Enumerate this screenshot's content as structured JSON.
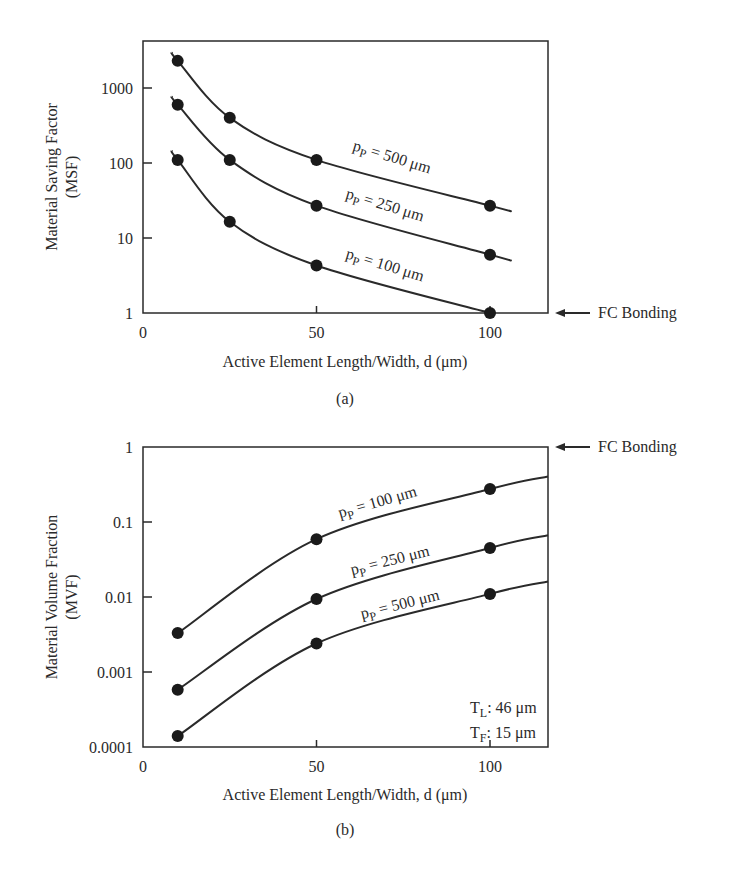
{
  "chart_data": [
    {
      "panel": "(a)",
      "type": "line",
      "title": "",
      "xlabel": "Active Element Length/Width, d (μm)",
      "ylabel": "Material Saving Factor",
      "ylabel_sub": "(MSF)",
      "yscale": "log",
      "xlim": [
        0,
        115
      ],
      "ylim": [
        1,
        4000
      ],
      "x_ticks": [
        0,
        50,
        100
      ],
      "y_ticks": [
        1,
        10,
        100,
        1000
      ],
      "y_tick_labels": [
        "1",
        "10",
        "100",
        "1000"
      ],
      "grid": false,
      "annotation": "FC Bonding",
      "annotation_value": 1,
      "series": [
        {
          "name": "pP = 500 μm",
          "label_main": "p",
          "label_sub": "P",
          "label_rest": " = 500 μm",
          "x": [
            10,
            25,
            50,
            100
          ],
          "values": [
            2300,
            400,
            110,
            27
          ]
        },
        {
          "name": "pP = 250 μm",
          "label_main": "p",
          "label_sub": "P",
          "label_rest": " = 250 μm",
          "x": [
            10,
            25,
            50,
            100
          ],
          "values": [
            600,
            110,
            27,
            6
          ]
        },
        {
          "name": "pP = 100 μm",
          "label_main": "p",
          "label_sub": "P",
          "label_rest": " = 100 μm",
          "x": [
            10,
            25,
            50,
            100
          ],
          "values": [
            110,
            16.5,
            4.3,
            1
          ]
        }
      ]
    },
    {
      "panel": "(b)",
      "type": "line",
      "title": "",
      "xlabel": "Active Element Length/Width, d (μm)",
      "ylabel": "Material Volume Fraction",
      "ylabel_sub": "(MVF)",
      "yscale": "log",
      "xlim": [
        0,
        115
      ],
      "ylim": [
        0.0001,
        1
      ],
      "x_ticks": [
        0,
        50,
        100
      ],
      "y_ticks": [
        0.0001,
        0.001,
        0.01,
        0.1,
        1
      ],
      "y_tick_labels": [
        "0.0001",
        "0.001",
        "0.01",
        "0.1",
        "1"
      ],
      "grid": false,
      "annotation": "FC Bonding",
      "annotation_value": 1,
      "params": [
        {
          "main": "T",
          "sub": "L",
          "rest": ": 46 μm"
        },
        {
          "main": "T",
          "sub": "F",
          "rest": ": 15 μm"
        }
      ],
      "series": [
        {
          "name": "pP = 100 μm",
          "label_main": "p",
          "label_sub": "P",
          "label_rest": " = 100 μm",
          "x": [
            10,
            50,
            100
          ],
          "values": [
            0.0033,
            0.059,
            0.275
          ]
        },
        {
          "name": "pP = 250 μm",
          "label_main": "p",
          "label_sub": "P",
          "label_rest": " = 250 μm",
          "x": [
            10,
            50,
            100
          ],
          "values": [
            0.00058,
            0.0094,
            0.045
          ]
        },
        {
          "name": "pP = 500 μm",
          "label_main": "p",
          "label_sub": "P",
          "label_rest": " = 500 μm",
          "x": [
            10,
            50,
            100
          ],
          "values": [
            0.00014,
            0.0024,
            0.011
          ]
        }
      ]
    }
  ]
}
